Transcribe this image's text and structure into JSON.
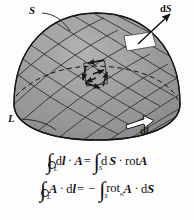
{
  "figure": {
    "kind": "stokes-theorem-diagram",
    "colors": {
      "surface_fill": "#9a9a9a",
      "surface_fill_light": "#b0b0b0",
      "surface_fill_dark": "#8a8a8a",
      "mesh_line": "#2b2b2b",
      "outline": "#1a1a1a",
      "patch_fill": "#ffffff",
      "arrow_fill": "#ffffff",
      "text": "#111111",
      "background": "#fdfdfd"
    }
  },
  "labels": {
    "surface": "S",
    "curve": "L",
    "area_element_d": "d",
    "area_element_S": "S",
    "line_element_d": "d",
    "line_element_l": "l"
  },
  "equations": {
    "eq1": {
      "oint_subscript": "L",
      "dl_d": "d",
      "dl_l": "l",
      "dot": "·",
      "A": "A",
      "equals": "=",
      "int_subscript": "S",
      "dS_d": "d",
      "dS_S": "S",
      "dot2": "·",
      "rot": "rot",
      "A2": "A",
      "plain": "∮L dl · A = ∫S dS · rot A"
    },
    "eq2": {
      "oint_subscript": "L",
      "A": "A",
      "dot": "·",
      "dl_d": "d",
      "dl_l": "l",
      "equals": "=",
      "minus": "−",
      "int_subscript": "S",
      "rot": "rot",
      "rot_sub": "n",
      "A2": "A",
      "dot2": "·",
      "dS_d": "d",
      "dS_S": "S",
      "plain": "∮L A · dl = − ∫S rotn A · dS"
    }
  },
  "annotations": {
    "dS_arrow": "outward normal vector arrow from white surface patch",
    "dl_arrow": "tangent arrow along boundary curve L",
    "circulation_arrows": "small arrows showing circulation around a mesh cell (curl)",
    "hidden_edge": "dashed ellipse indicating hidden back rim of the surface"
  }
}
